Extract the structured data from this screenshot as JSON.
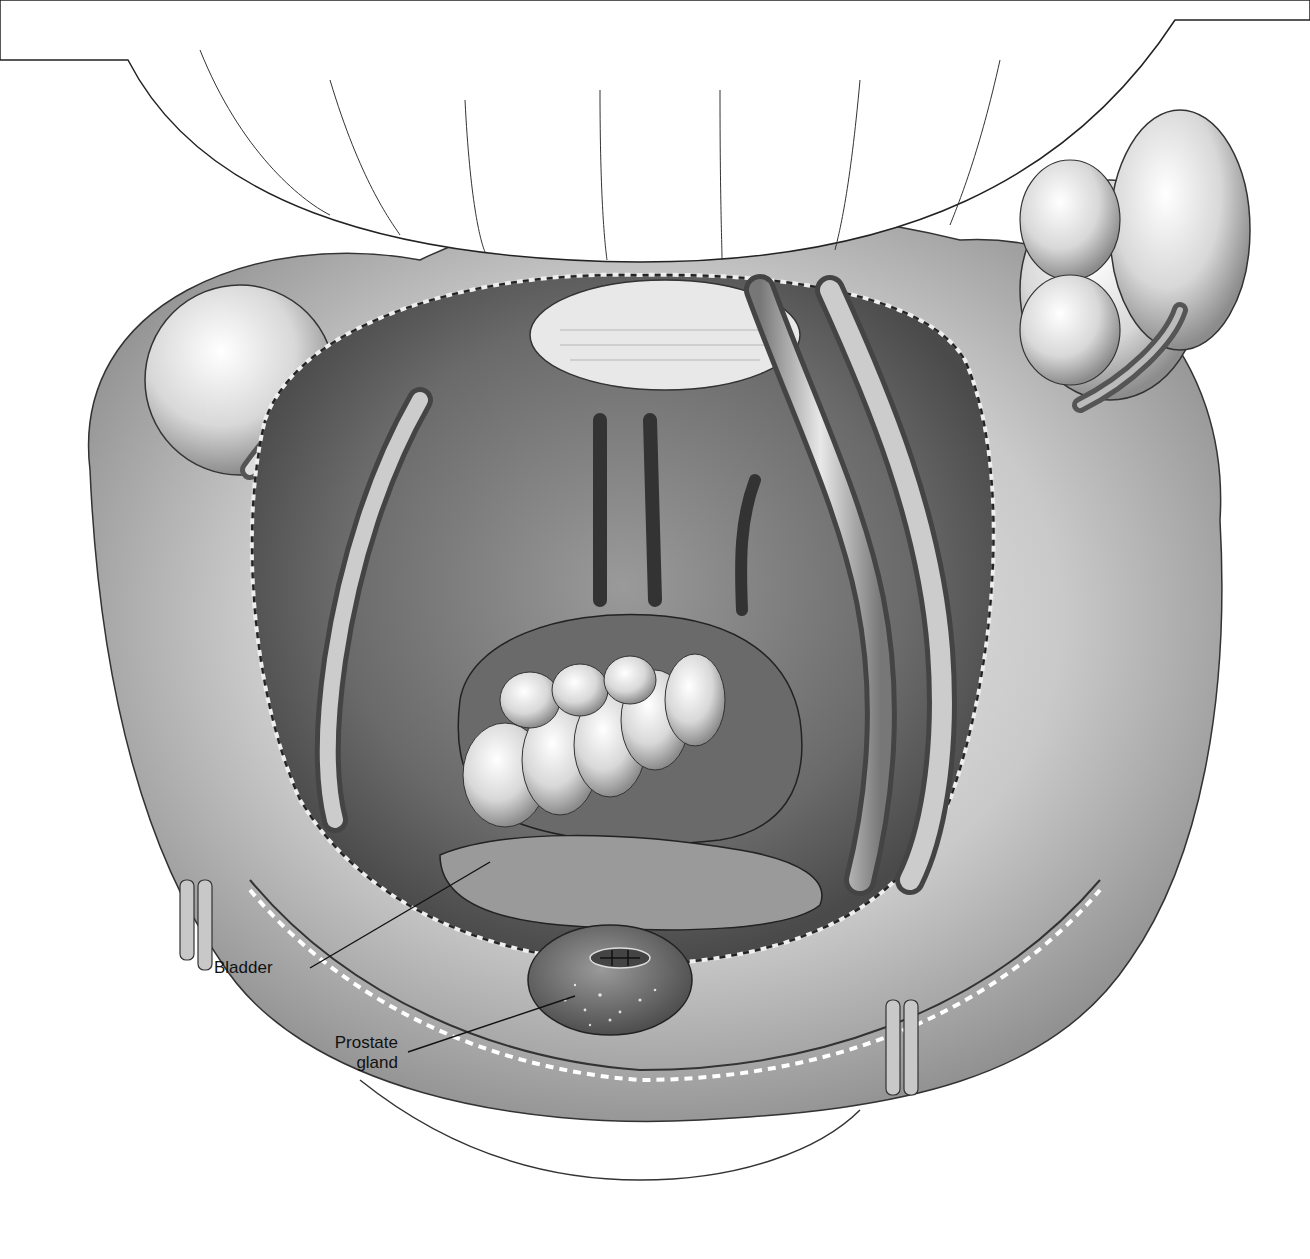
{
  "figure": {
    "style": "grayscale medical illustration",
    "background": "#ffffff",
    "ink": "#111111"
  },
  "labels": [
    {
      "id": "bladder",
      "text": "Bladder"
    },
    {
      "id": "prostate",
      "line1": "Prostate",
      "line2": "gland"
    }
  ]
}
